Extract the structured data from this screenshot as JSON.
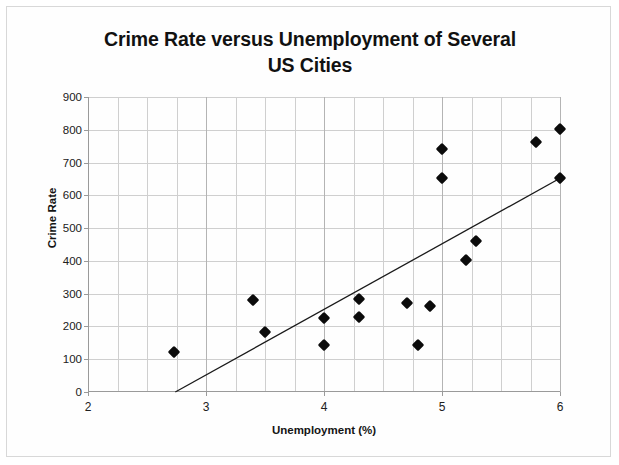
{
  "chart_data": {
    "type": "scatter",
    "title": "Crime Rate versus Unemployment of Several US Cities",
    "title_line1": "Crime Rate versus Unemployment of Several",
    "title_line2": "US Cities",
    "xlabel": "Unemployment (%)",
    "ylabel": "Crime Rate",
    "xlim": [
      2,
      6
    ],
    "ylim": [
      0,
      900
    ],
    "xticks": [
      2,
      3,
      4,
      5,
      6
    ],
    "xtick_labels": [
      "2",
      "3",
      "4",
      "5",
      "6"
    ],
    "x_minor_step": 0.25,
    "yticks": [
      0,
      100,
      200,
      300,
      400,
      500,
      600,
      700,
      800,
      900
    ],
    "ytick_labels": [
      "0",
      "100",
      "200",
      "300",
      "400",
      "500",
      "600",
      "700",
      "800",
      "900"
    ],
    "grid": "horizontal-and-vertical",
    "legend": "none",
    "marker_shape": "diamond",
    "marker_color": "#0b0b0b",
    "points": [
      {
        "x": 2.73,
        "y": 122
      },
      {
        "x": 3.4,
        "y": 282
      },
      {
        "x": 3.5,
        "y": 184
      },
      {
        "x": 4.0,
        "y": 225
      },
      {
        "x": 4.0,
        "y": 142
      },
      {
        "x": 4.3,
        "y": 283
      },
      {
        "x": 4.3,
        "y": 230
      },
      {
        "x": 4.7,
        "y": 272
      },
      {
        "x": 4.9,
        "y": 262
      },
      {
        "x": 4.8,
        "y": 142
      },
      {
        "x": 5.0,
        "y": 741
      },
      {
        "x": 5.0,
        "y": 652
      },
      {
        "x": 5.2,
        "y": 403
      },
      {
        "x": 5.29,
        "y": 462
      },
      {
        "x": 5.8,
        "y": 764
      },
      {
        "x": 6.0,
        "y": 803
      },
      {
        "x": 6.0,
        "y": 654
      }
    ],
    "trendline": {
      "type": "line",
      "x_start": 2.74,
      "y_start": 0,
      "x_end": 6.0,
      "y_end": 652,
      "color": "#1a1a1a"
    }
  }
}
